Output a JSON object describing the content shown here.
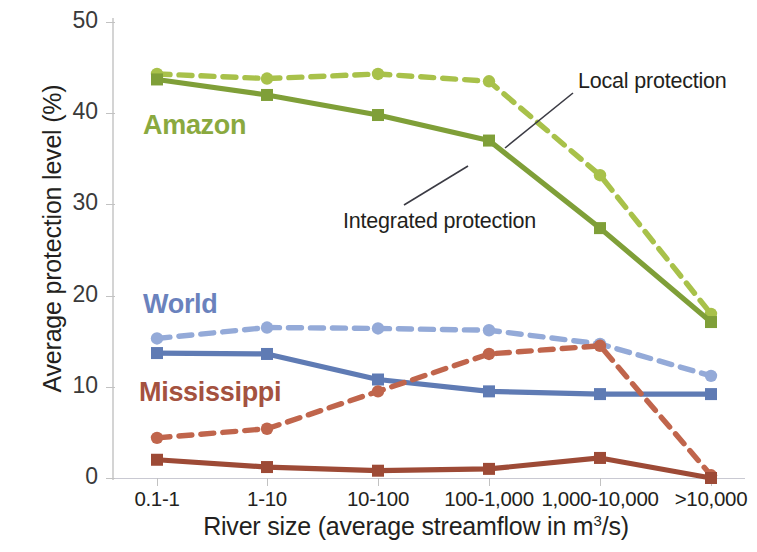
{
  "chart_data": {
    "type": "line",
    "title": "",
    "xlabel": "River size (average streamflow in m³/s)",
    "ylabel": "Average protection level (%)",
    "categories": [
      "0.1-1",
      "1-10",
      "10-100",
      "100-1,000",
      "1,000-10,000",
      ">10,000"
    ],
    "ylim": [
      0,
      50
    ],
    "yticks": [
      0,
      10,
      20,
      30,
      40,
      50
    ],
    "grid": false,
    "legend_position": "inline-annotations",
    "series": [
      {
        "name": "Amazon – Local protection",
        "group": "Amazon",
        "style": "dashed",
        "color": "#a8c14a",
        "values": [
          44.3,
          43.8,
          44.3,
          43.5,
          33.2,
          18.0
        ]
      },
      {
        "name": "Amazon – Integrated protection",
        "group": "Amazon",
        "style": "solid",
        "color": "#7f9f38",
        "values": [
          43.7,
          42.0,
          39.8,
          37.0,
          27.4,
          17.1
        ]
      },
      {
        "name": "World – Local protection",
        "group": "World",
        "style": "dashed",
        "color": "#94aad8",
        "values": [
          15.3,
          16.5,
          16.4,
          16.2,
          14.7,
          11.2
        ]
      },
      {
        "name": "World – Integrated protection",
        "group": "World",
        "style": "solid",
        "color": "#5f7bb4",
        "values": [
          13.7,
          13.6,
          10.8,
          9.5,
          9.2,
          9.2
        ]
      },
      {
        "name": "Mississippi – Local protection",
        "group": "Mississippi",
        "style": "dashed",
        "color": "#c0654c",
        "values": [
          4.4,
          5.4,
          9.5,
          13.6,
          14.5,
          0.3
        ]
      },
      {
        "name": "Mississippi – Integrated protection",
        "group": "Mississippi",
        "style": "solid",
        "color": "#9d4a36",
        "values": [
          2.0,
          1.2,
          0.8,
          1.0,
          2.2,
          0.0
        ]
      }
    ],
    "group_labels": [
      {
        "text": "Amazon",
        "color": "#8aa93f"
      },
      {
        "text": "World",
        "color": "#6a82bd"
      },
      {
        "text": "Mississippi",
        "color": "#a4523f"
      }
    ],
    "annotations": [
      {
        "text": "Local protection",
        "target": "dashed lines"
      },
      {
        "text": "Integrated protection",
        "target": "solid lines"
      }
    ]
  },
  "axes": {
    "y": {
      "title_text": "Average protection level (%)",
      "tick_labels": [
        "50",
        "40",
        "30",
        "20",
        "10",
        "0"
      ]
    },
    "x": {
      "title_prefix": "River size (average streamflow in m",
      "title_sup": "3",
      "title_suffix": "/s)",
      "tick_labels": [
        "0.1-1",
        "1-10",
        "10-100",
        "100-1,000",
        "1,000-10,000",
        ">10,000"
      ]
    }
  },
  "labels": {
    "amazon": "Amazon",
    "world": "World",
    "mississippi": "Mississippi"
  },
  "annotations": {
    "local": "Local protection",
    "integrated": "Integrated protection"
  }
}
